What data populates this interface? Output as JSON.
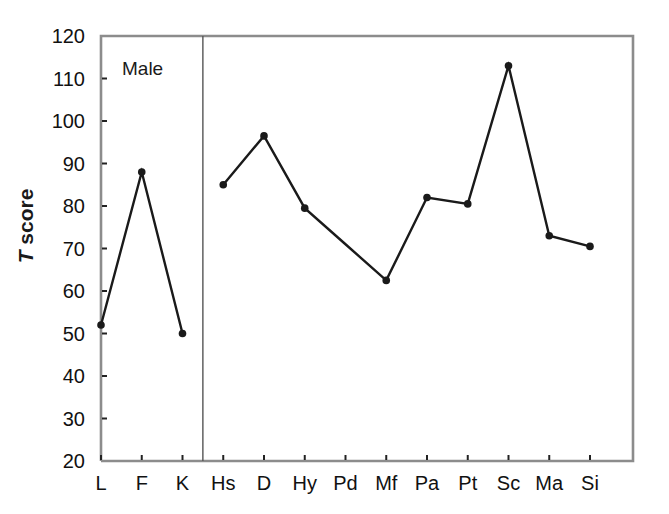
{
  "figure": {
    "panel_label": "Male",
    "width": 669,
    "height": 514,
    "background": "#ffffff",
    "line_color": "#1a1a1a",
    "marker_color": "#1a1a1a",
    "frame_color": "#8c8c8c",
    "divider_color": "#555555",
    "text_color": "#111111"
  },
  "axis_title": {
    "italic_part": "T",
    "rest_part": " score"
  },
  "chart_data": {
    "type": "line",
    "title": "",
    "subtitle": "",
    "xlabel": "",
    "ylabel": "T score",
    "annotations": [
      "Male"
    ],
    "grid": false,
    "legend": "none",
    "ylim": [
      20,
      120
    ],
    "ytick_step": 10,
    "yticks": [
      20,
      30,
      40,
      50,
      60,
      70,
      80,
      90,
      100,
      110,
      120
    ],
    "ytick_labels": [
      "20",
      "30",
      "40",
      "50",
      "60",
      "70",
      "80",
      "90",
      "100",
      "110",
      "120"
    ],
    "categories": [
      "L",
      "F",
      "K",
      "Hs",
      "D",
      "Hy",
      "Pd",
      "Mf",
      "Pa",
      "Pt",
      "Sc",
      "Ma",
      "Si"
    ],
    "values": [
      52,
      88,
      50,
      85,
      96.5,
      79.5,
      71,
      62.5,
      82,
      80.5,
      113,
      73,
      70.5
    ],
    "markers_visible": [
      true,
      true,
      true,
      true,
      true,
      true,
      false,
      true,
      true,
      true,
      true,
      true,
      true
    ],
    "segments": [
      {
        "from": "L",
        "to": "K",
        "note": "validity scales"
      },
      {
        "from": "Hs",
        "to": "Si",
        "note": "clinical scales"
      }
    ],
    "divider_after_category": "K",
    "series": [
      {
        "name": "Male",
        "values": [
          52,
          88,
          50,
          85,
          96.5,
          79.5,
          71,
          62.5,
          82,
          80.5,
          113,
          73,
          70.5
        ]
      }
    ]
  }
}
